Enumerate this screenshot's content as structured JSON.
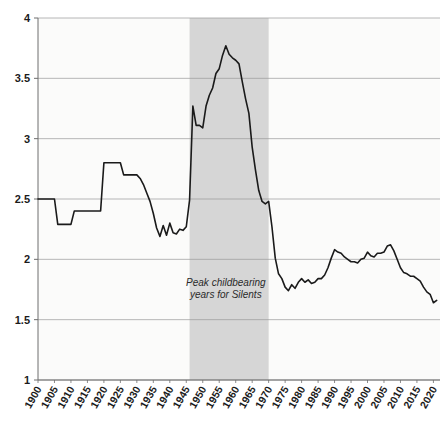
{
  "chart_data": {
    "type": "line",
    "title": "",
    "subtitle": "",
    "xlabel": "",
    "ylabel": "",
    "xlim": [
      1900,
      2022
    ],
    "ylim": [
      1,
      4
    ],
    "grid": true,
    "grid_axis": "y",
    "legend": "none",
    "line_color": "#1a1a1a",
    "plot_background": "#fbfbfa",
    "page_background": "#ffffff",
    "ytick_labels": [
      "1",
      "1.5",
      "2",
      "2.5",
      "3",
      "3.5",
      "4"
    ],
    "ytick_values": [
      1,
      1.5,
      2,
      2.5,
      3,
      3.5,
      4
    ],
    "xtick_labels": [
      "1900",
      "1905",
      "1910",
      "1915",
      "1920",
      "1925",
      "1930",
      "1935",
      "1940",
      "1945",
      "1950",
      "1955",
      "1960",
      "1965",
      "1970",
      "1975",
      "1980",
      "1985",
      "1990",
      "1995",
      "2000",
      "2005",
      "2010",
      "2015",
      "2020"
    ],
    "xtick_values": [
      1900,
      1905,
      1910,
      1915,
      1920,
      1925,
      1930,
      1935,
      1940,
      1945,
      1950,
      1955,
      1960,
      1965,
      1970,
      1975,
      1980,
      1985,
      1990,
      1995,
      2000,
      2005,
      2010,
      2015,
      2020
    ],
    "xtick_rotation": -60,
    "annotations": [
      {
        "name": "peak-childbearing-note",
        "line1": "Peak childbearing",
        "line2": "years for Silents",
        "x": 1957,
        "y": 1.78,
        "style": "italic"
      }
    ],
    "shaded_bands": [
      {
        "name": "peak-childbearing-band",
        "x_start": 1946,
        "x_end": 1970,
        "color": "#d6d6d6"
      }
    ],
    "series": [
      {
        "name": "Total Fertility Rate",
        "color": "#1a1a1a",
        "x": [
          1900,
          1901,
          1902,
          1903,
          1904,
          1905,
          1906,
          1907,
          1908,
          1909,
          1910,
          1911,
          1912,
          1913,
          1914,
          1915,
          1916,
          1917,
          1918,
          1919,
          1920,
          1921,
          1922,
          1923,
          1924,
          1925,
          1926,
          1927,
          1928,
          1929,
          1930,
          1931,
          1932,
          1933,
          1934,
          1935,
          1936,
          1937,
          1938,
          1939,
          1940,
          1941,
          1942,
          1943,
          1944,
          1945,
          1946,
          1947,
          1948,
          1949,
          1950,
          1951,
          1952,
          1953,
          1954,
          1955,
          1956,
          1957,
          1958,
          1959,
          1960,
          1961,
          1962,
          1963,
          1964,
          1965,
          1966,
          1967,
          1968,
          1969,
          1970,
          1971,
          1972,
          1973,
          1974,
          1975,
          1976,
          1977,
          1978,
          1979,
          1980,
          1981,
          1982,
          1983,
          1984,
          1985,
          1986,
          1987,
          1988,
          1989,
          1990,
          1991,
          1992,
          1993,
          1994,
          1995,
          1996,
          1997,
          1998,
          1999,
          2000,
          2001,
          2002,
          2003,
          2004,
          2005,
          2006,
          2007,
          2008,
          2009,
          2010,
          2011,
          2012,
          2013,
          2014,
          2015,
          2016,
          2017,
          2018,
          2019,
          2020,
          2021
        ],
        "y": [
          2.5,
          2.5,
          2.5,
          2.5,
          2.5,
          2.5,
          2.29,
          2.29,
          2.29,
          2.29,
          2.29,
          2.4,
          2.4,
          2.4,
          2.4,
          2.4,
          2.4,
          2.4,
          2.4,
          2.4,
          2.8,
          2.8,
          2.8,
          2.8,
          2.8,
          2.8,
          2.7,
          2.7,
          2.7,
          2.7,
          2.7,
          2.67,
          2.62,
          2.55,
          2.48,
          2.38,
          2.26,
          2.19,
          2.28,
          2.2,
          2.3,
          2.22,
          2.21,
          2.25,
          2.24,
          2.27,
          2.49,
          3.27,
          3.11,
          3.11,
          3.09,
          3.27,
          3.36,
          3.42,
          3.54,
          3.58,
          3.69,
          3.77,
          3.7,
          3.67,
          3.65,
          3.62,
          3.47,
          3.33,
          3.21,
          2.93,
          2.74,
          2.57,
          2.48,
          2.46,
          2.48,
          2.27,
          2.01,
          1.88,
          1.84,
          1.77,
          1.74,
          1.79,
          1.76,
          1.81,
          1.84,
          1.81,
          1.83,
          1.8,
          1.81,
          1.84,
          1.84,
          1.87,
          1.93,
          2.01,
          2.08,
          2.06,
          2.05,
          2.02,
          2.0,
          1.98,
          1.98,
          1.97,
          2.0,
          2.01,
          2.06,
          2.03,
          2.02,
          2.05,
          2.05,
          2.06,
          2.11,
          2.12,
          2.07,
          2.0,
          1.93,
          1.89,
          1.88,
          1.86,
          1.86,
          1.84,
          1.82,
          1.77,
          1.73,
          1.71,
          1.64,
          1.66
        ]
      }
    ]
  }
}
